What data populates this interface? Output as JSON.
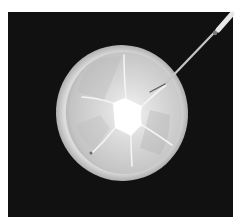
{
  "image": {
    "description": "Photograph of a circular translucent disc with a star-shaped slit pattern around a central opening, being touched by a thin probe, on a black background",
    "subject": "disc with radial cuts",
    "instrument": "probe",
    "colors": {
      "page_background": "#ffffff",
      "backdrop": "#111111",
      "disc_fill": "#cfcfcf",
      "disc_rim": "#e6e6e6",
      "center_opening": "#ffffff",
      "slit_lines": "#f4f4f4",
      "probe": "#bdbdbd"
    }
  }
}
